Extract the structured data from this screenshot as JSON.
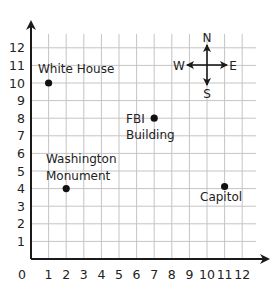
{
  "map": {
    "type": "coordinate-grid",
    "x_axis": {
      "min": 0,
      "max": 12,
      "ticks": [
        "0",
        "1",
        "2",
        "3",
        "4",
        "5",
        "6",
        "7",
        "8",
        "9",
        "10",
        "11",
        "12"
      ]
    },
    "y_axis": {
      "min": 0,
      "max": 12,
      "ticks": [
        "1",
        "2",
        "3",
        "4",
        "5",
        "6",
        "7",
        "8",
        "9",
        "10",
        "11",
        "12"
      ]
    },
    "compass": {
      "north": "N",
      "south": "S",
      "east": "E",
      "west": "W",
      "center": [
        10,
        11
      ]
    },
    "locations": [
      {
        "name": "White House",
        "x": 1,
        "y": 10,
        "label_lines": [
          "White House"
        ]
      },
      {
        "name": "FBI Building",
        "x": 7,
        "y": 8,
        "label_lines": [
          "FBI",
          "Building"
        ]
      },
      {
        "name": "Washington Monument",
        "x": 2,
        "y": 4,
        "label_lines": [
          "Washington",
          "Monument"
        ]
      },
      {
        "name": "Capitol",
        "x": 11,
        "y": 4,
        "label_lines": [
          "Capitol"
        ]
      }
    ]
  },
  "labels": {
    "origin": "0",
    "white_house": "White House",
    "fbi_1": "FBI",
    "fbi_2": "Building",
    "wash_1": "Washington",
    "wash_2": "Monument",
    "capitol": "Capitol",
    "n": "N",
    "s": "S",
    "e": "E",
    "w": "W"
  },
  "colors": {
    "grid": "#bdbdbd",
    "axis": "#1a1a1a",
    "point": "#111111",
    "text": "#222222"
  }
}
